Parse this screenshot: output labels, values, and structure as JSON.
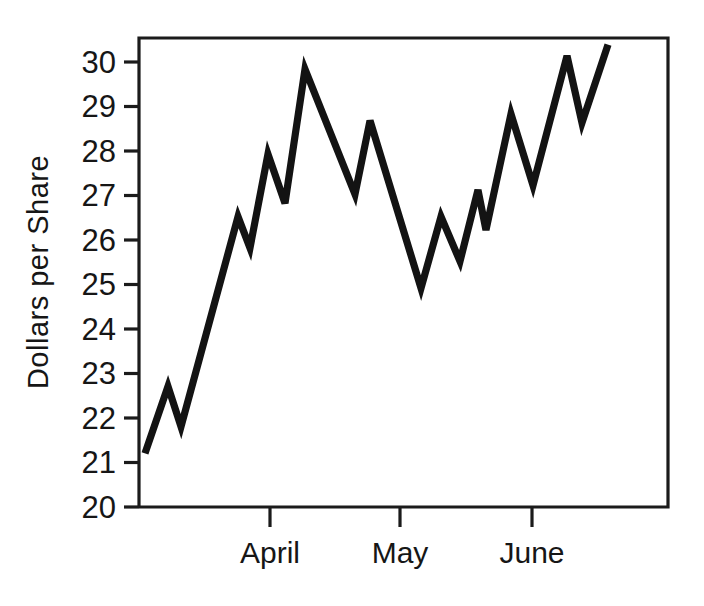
{
  "chart_data": {
    "type": "line",
    "title": "",
    "xlabel": "",
    "ylabel": "Dollars per Share",
    "ylim": [
      20,
      30.5
    ],
    "ytick_labels": [
      "30",
      "29",
      "28",
      "27",
      "26",
      "25",
      "24",
      "23",
      "22",
      "21",
      "20"
    ],
    "yticks": [
      30,
      29,
      28,
      27,
      26,
      25,
      24,
      23,
      22,
      21,
      20
    ],
    "x_category_labels": [
      "April",
      "May",
      "June"
    ],
    "x_category_positions": [
      0.2476,
      0.4934,
      0.7429
    ],
    "grid": false,
    "legend": null,
    "series": [
      {
        "name": "Share price",
        "x": [
          0.0113,
          0.0548,
          0.0794,
          0.1872,
          0.2098,
          0.2438,
          0.276,
          0.3138,
          0.4083,
          0.4367,
          0.5331,
          0.5709,
          0.6068,
          0.6408,
          0.6559,
          0.7032,
          0.7448,
          0.8091,
          0.8374,
          0.8866
        ],
        "values": [
          21.2,
          22.7,
          21.8,
          26.5,
          25.8,
          27.9,
          26.8,
          29.8,
          27.0,
          28.65,
          24.9,
          26.5,
          25.5,
          27.1,
          26.2,
          28.8,
          27.2,
          30.1,
          28.6,
          30.35
        ]
      }
    ]
  },
  "axes": {
    "y_title": "Dollars per Share",
    "y_ticks": [
      "30",
      "29",
      "28",
      "27",
      "26",
      "25",
      "24",
      "23",
      "22",
      "21",
      "20"
    ],
    "x_ticks": [
      "April",
      "May",
      "June"
    ]
  },
  "colors": {
    "line": "#131313",
    "frame": "#1b1b1b",
    "text": "#161616",
    "background": "#ffffff"
  }
}
